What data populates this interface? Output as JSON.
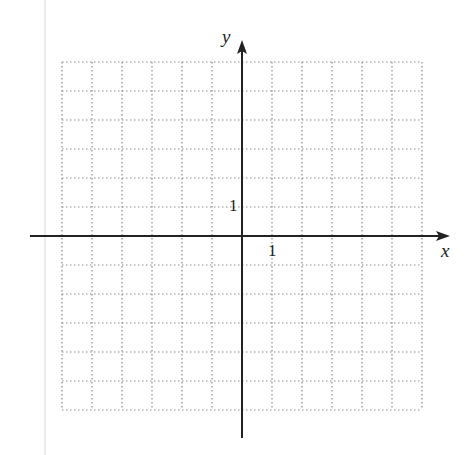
{
  "figure": {
    "type": "coordinate-grid",
    "x_axis": {
      "label": "x",
      "unit_tick_label": "1"
    },
    "y_axis": {
      "label": "y",
      "unit_tick_label": "1"
    },
    "grid": {
      "columns": 12,
      "rows": 12,
      "x_range": [
        -6,
        6
      ],
      "y_range": [
        -6,
        6
      ],
      "style": "dotted"
    },
    "colors": {
      "grid": "#8a8a8a",
      "axis": "#222222",
      "page_edge": "#ececec"
    }
  }
}
